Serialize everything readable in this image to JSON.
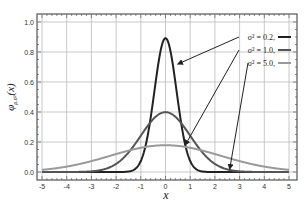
{
  "chart_data": {
    "type": "line",
    "title": "",
    "xlabel": "x",
    "ylabel": "φμ,σ²(x)",
    "xlim": [
      -5,
      5
    ],
    "ylim": [
      0,
      1.0
    ],
    "grid": true,
    "xticks": [
      -5,
      -4,
      -3,
      -2,
      -1,
      0,
      1,
      2,
      3,
      4,
      5
    ],
    "yticks": [
      0.0,
      0.2,
      0.4,
      0.6,
      0.8,
      1.0
    ],
    "ytick_labels": [
      "0.0",
      "0.2",
      "0.4",
      "0.6",
      "0.8",
      "1.0"
    ],
    "legend_position": "upper right",
    "series": [
      {
        "name": "σ² = 0.2,",
        "mu": 0,
        "variance": 0.2,
        "peak": 0.89,
        "color": "#222222",
        "width": 2.0
      },
      {
        "name": "σ² = 1.0,",
        "mu": 0,
        "variance": 1.0,
        "peak": 0.4,
        "color": "#555555",
        "width": 2.0
      },
      {
        "name": "σ² = 5.0,",
        "mu": 0,
        "variance": 5.0,
        "peak": 0.18,
        "color": "#999999",
        "width": 2.0
      }
    ],
    "annotations": [
      {
        "text": "σ² = 0.2,",
        "arrow_to": [
          0.5,
          0.72
        ]
      },
      {
        "text": "σ² = 1.0,",
        "arrow_to": [
          0.8,
          0.18
        ]
      },
      {
        "text": "σ² = 5.0,",
        "arrow_to": [
          2.6,
          0.02
        ]
      }
    ]
  }
}
